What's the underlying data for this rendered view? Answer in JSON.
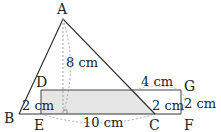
{
  "diagram": {
    "type": "geometry",
    "points": {
      "A": "A",
      "B": "B",
      "C": "C",
      "D": "D",
      "E": "E",
      "F": "F",
      "G": "G"
    },
    "labels": {
      "height_AE": "8 cm",
      "side_DE": "2 cm",
      "base_EC": "10 cm",
      "top_GC_seg": "4 cm",
      "side_CF_inner": "2 cm",
      "side_GF": "2 cm"
    },
    "colors": {
      "line": "#333333",
      "shade": "#e6e6e6",
      "dashed": "#999999"
    }
  }
}
